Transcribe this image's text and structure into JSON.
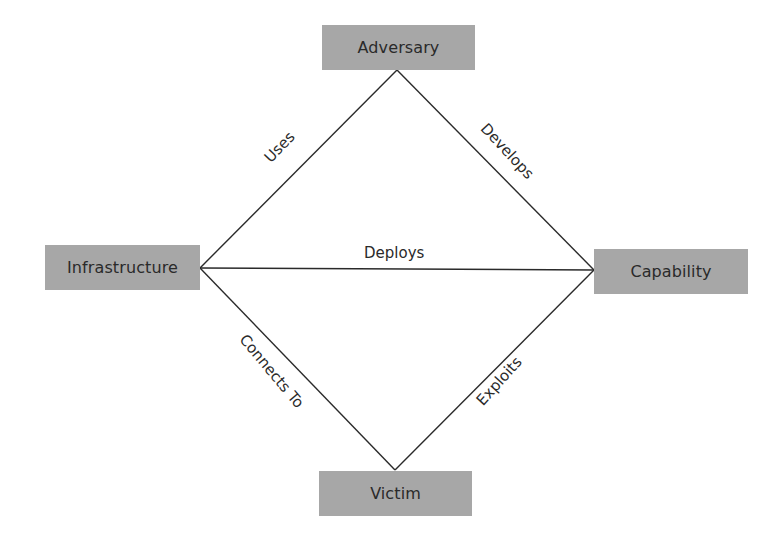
{
  "diagram": {
    "type": "diamond-model",
    "nodes": [
      {
        "id": "adversary",
        "label": "Adversary"
      },
      {
        "id": "infrastructure",
        "label": "Infrastructure"
      },
      {
        "id": "capability",
        "label": "Capability"
      },
      {
        "id": "victim",
        "label": "Victim"
      }
    ],
    "edges": [
      {
        "from": "adversary",
        "to": "infrastructure",
        "label": "Uses"
      },
      {
        "from": "adversary",
        "to": "capability",
        "label": "Develops"
      },
      {
        "from": "infrastructure",
        "to": "capability",
        "label": "Deploys"
      },
      {
        "from": "infrastructure",
        "to": "victim",
        "label": "Connects To"
      },
      {
        "from": "capability",
        "to": "victim",
        "label": "Exploits"
      }
    ],
    "colors": {
      "node_fill": "#a7a7a7",
      "line": "#2a2a2a",
      "text": "#2a2a2a",
      "background": "#ffffff"
    }
  }
}
